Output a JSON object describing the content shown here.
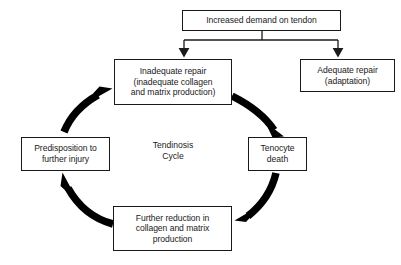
{
  "diagram": {
    "title": "Tendinosis Cycle",
    "center_label": "Tendinosis\nCycle",
    "colors": {
      "stroke": "#1a1a1a",
      "box_fill": "#ffffff",
      "background": "#ffffff",
      "text": "#1a1a1a",
      "caption_text": "#cfcfcf"
    },
    "nodes": [
      {
        "id": "increased-demand",
        "label": "Increased demand on tendon",
        "lines": 1
      },
      {
        "id": "inadequate-repair",
        "label": "Inadequate repair\n(inadequate collagen\nand matrix production)",
        "lines": 3
      },
      {
        "id": "adequate-repair",
        "label": "Adequate repair\n(adaptation)",
        "lines": 2
      },
      {
        "id": "tenocyte-death",
        "label": "Tenocyte\ndeath",
        "lines": 2
      },
      {
        "id": "predisposition",
        "label": "Predisposition to\nfurther injury",
        "lines": 2
      },
      {
        "id": "further-reduction",
        "label": "Further reduction in\ncollagen and matrix\nproduction",
        "lines": 3
      }
    ],
    "connectors": [
      {
        "id": "demand-to-inadequate",
        "from": "increased-demand",
        "to": "inadequate-repair",
        "style": "straight-elbow",
        "arrowhead": "down"
      },
      {
        "id": "demand-to-adequate",
        "from": "increased-demand",
        "to": "adequate-repair",
        "style": "straight-elbow",
        "arrowhead": "down"
      },
      {
        "id": "inadequate-to-tenocyte",
        "from": "inadequate-repair",
        "to": "tenocyte-death",
        "style": "thick-curved-arc",
        "arrowhead": "down-right"
      },
      {
        "id": "tenocyte-to-further-reduction",
        "from": "tenocyte-death",
        "to": "further-reduction",
        "style": "thick-curved-arc",
        "arrowhead": "down-left"
      },
      {
        "id": "further-reduction-to-predisposition",
        "from": "further-reduction",
        "to": "predisposition",
        "style": "thick-curved-arc",
        "arrowhead": "up-left"
      },
      {
        "id": "predisposition-to-inadequate",
        "from": "predisposition",
        "to": "inadequate-repair",
        "style": "thick-curved-arc",
        "arrowhead": "up-right"
      }
    ],
    "caption_fragment": "."
  }
}
